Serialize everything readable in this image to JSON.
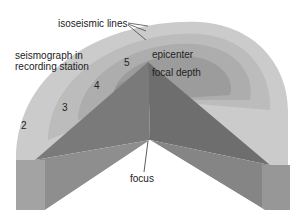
{
  "diagram": {
    "title": "",
    "labels": {
      "isoseismic_lines": "isoseismic lines",
      "seismograph_line1": "seismograph in",
      "seismograph_line2": "recording station",
      "epicenter": "epicenter",
      "focal_depth": "focal depth",
      "focus": "focus"
    },
    "intensity_zones": [
      "2",
      "3",
      "4",
      "5"
    ],
    "colors": {
      "zone_outer": "#c9c9c9",
      "zone_2": "#bdbdbd",
      "zone_3": "#b0b0b0",
      "zone_4": "#a2a2a2",
      "zone_5": "#949494",
      "wedge_dark": "#6f6f6f",
      "wedge_mid": "#7f7f7f",
      "side_face": "#8c8c8c",
      "side_face_light": "#a0a0a0"
    }
  }
}
